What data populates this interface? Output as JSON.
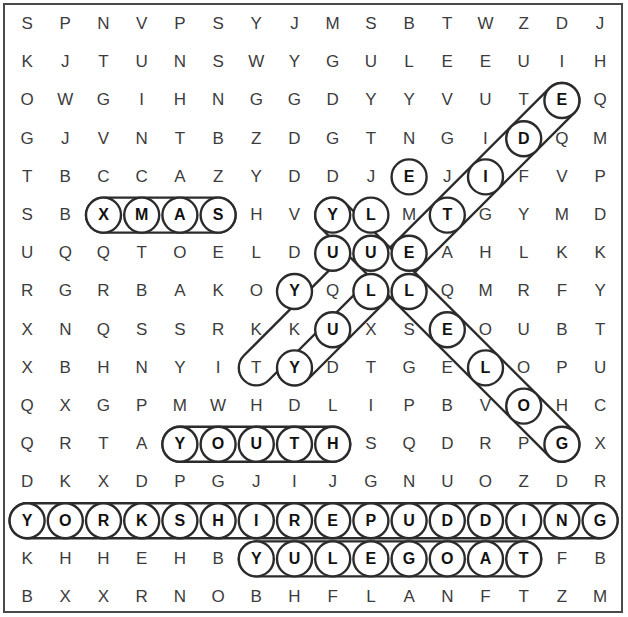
{
  "puzzle": {
    "type": "word-search",
    "rows": 16,
    "cols": 17,
    "border_color": "#4a4a4a",
    "letter_color": "#3c3c3c",
    "found_letter_color": "#111111",
    "highlight_color": "#2b2b2b",
    "grid": [
      [
        "S",
        "P",
        "N",
        "V",
        "P",
        "S",
        "Y",
        "J",
        "M",
        "S",
        "B",
        "T",
        "W",
        "Z",
        "D",
        "J",
        ""
      ],
      [
        "K",
        "J",
        "T",
        "U",
        "N",
        "S",
        "W",
        "Y",
        "G",
        "U",
        "L",
        "E",
        "E",
        "U",
        "I",
        "H",
        ""
      ],
      [
        "O",
        "W",
        "G",
        "I",
        "H",
        "N",
        "G",
        "G",
        "D",
        "Y",
        "Y",
        "V",
        "U",
        "T",
        "E",
        "Q",
        ""
      ],
      [
        "G",
        "J",
        "V",
        "N",
        "T",
        "B",
        "Z",
        "D",
        "G",
        "T",
        "N",
        "G",
        "I",
        "D",
        "Q",
        "M",
        ""
      ],
      [
        "T",
        "B",
        "C",
        "C",
        "A",
        "Z",
        "Y",
        "D",
        "D",
        "J",
        "E",
        "J",
        "I",
        "F",
        "V",
        "P",
        ""
      ],
      [
        "S",
        "B",
        "X",
        "M",
        "A",
        "S",
        "H",
        "V",
        "Y",
        "L",
        "M",
        "T",
        "G",
        "Y",
        "M",
        "D",
        ""
      ],
      [
        "U",
        "Q",
        "Q",
        "T",
        "O",
        "E",
        "L",
        "D",
        "U",
        "U",
        "E",
        "A",
        "H",
        "L",
        "K",
        "K",
        ""
      ],
      [
        "R",
        "G",
        "R",
        "B",
        "A",
        "K",
        "O",
        "Y",
        "Q",
        "L",
        "L",
        "Q",
        "M",
        "R",
        "F",
        "Y",
        ""
      ],
      [
        "X",
        "N",
        "Q",
        "S",
        "S",
        "R",
        "K",
        "K",
        "U",
        "X",
        "S",
        "E",
        "O",
        "U",
        "B",
        "T",
        ""
      ],
      [
        "X",
        "B",
        "H",
        "N",
        "Y",
        "I",
        "T",
        "Y",
        "D",
        "T",
        "G",
        "E",
        "L",
        "O",
        "P",
        "U",
        ""
      ],
      [
        "Q",
        "X",
        "G",
        "P",
        "M",
        "W",
        "H",
        "D",
        "L",
        "I",
        "P",
        "B",
        "V",
        "O",
        "H",
        "C",
        ""
      ],
      [
        "Q",
        "R",
        "T",
        "A",
        "Y",
        "O",
        "U",
        "T",
        "H",
        "S",
        "Q",
        "D",
        "R",
        "P",
        "G",
        "X",
        ""
      ],
      [
        "D",
        "K",
        "X",
        "D",
        "P",
        "G",
        "J",
        "I",
        "J",
        "G",
        "N",
        "U",
        "O",
        "Z",
        "D",
        "R",
        ""
      ],
      [
        "Y",
        "O",
        "R",
        "K",
        "S",
        "H",
        "I",
        "R",
        "E",
        "P",
        "U",
        "D",
        "D",
        "I",
        "N",
        "G",
        ""
      ],
      [
        "K",
        "H",
        "H",
        "E",
        "H",
        "B",
        "Y",
        "U",
        "L",
        "E",
        "G",
        "O",
        "A",
        "T",
        "F",
        "B",
        ""
      ],
      [
        "B",
        "X",
        "X",
        "R",
        "N",
        "O",
        "B",
        "H",
        "F",
        "L",
        "A",
        "N",
        "F",
        "T",
        "Z",
        "M",
        ""
      ]
    ],
    "found_words": [
      {
        "word": "XMAS",
        "orientation": "horizontal",
        "row": 5,
        "col": 2,
        "length": 4
      },
      {
        "word": "YULETIDE",
        "orientation": "diagonal-up-right",
        "row": 9,
        "col": 7,
        "length": 8
      },
      {
        "word": "YULE",
        "orientation": "diagonal-up-right",
        "row": 9,
        "col": 6,
        "length": 4
      },
      {
        "word": "YULELOG",
        "orientation": "diagonal-down-right",
        "row": 5,
        "col": 8,
        "length": 7
      },
      {
        "word": "YOUTH",
        "orientation": "horizontal",
        "row": 11,
        "col": 4,
        "length": 5
      },
      {
        "word": "YORKSHIREPUDDING",
        "orientation": "horizontal",
        "row": 13,
        "col": 0,
        "length": 16
      },
      {
        "word": "YULEGOAT",
        "orientation": "horizontal",
        "row": 14,
        "col": 6,
        "length": 8
      }
    ],
    "circled_cells": [
      {
        "row": 2,
        "col": 14,
        "letter": "E"
      },
      {
        "row": 3,
        "col": 13,
        "letter": "D"
      },
      {
        "row": 4,
        "col": 10,
        "letter": "E"
      },
      {
        "row": 4,
        "col": 12,
        "letter": "I"
      },
      {
        "row": 5,
        "col": 2,
        "letter": "X"
      },
      {
        "row": 5,
        "col": 3,
        "letter": "M"
      },
      {
        "row": 5,
        "col": 4,
        "letter": "A"
      },
      {
        "row": 5,
        "col": 5,
        "letter": "S"
      },
      {
        "row": 5,
        "col": 8,
        "letter": "Y"
      },
      {
        "row": 5,
        "col": 9,
        "letter": "L"
      },
      {
        "row": 5,
        "col": 11,
        "letter": "T"
      },
      {
        "row": 6,
        "col": 8,
        "letter": "U"
      },
      {
        "row": 6,
        "col": 9,
        "letter": "U"
      },
      {
        "row": 6,
        "col": 10,
        "letter": "E"
      },
      {
        "row": 7,
        "col": 7,
        "letter": "Y"
      },
      {
        "row": 7,
        "col": 9,
        "letter": "L"
      },
      {
        "row": 7,
        "col": 10,
        "letter": "L"
      },
      {
        "row": 8,
        "col": 8,
        "letter": "U"
      },
      {
        "row": 8,
        "col": 11,
        "letter": "E"
      },
      {
        "row": 9,
        "col": 7,
        "letter": "Y"
      },
      {
        "row": 9,
        "col": 12,
        "letter": "L"
      },
      {
        "row": 10,
        "col": 13,
        "letter": "O"
      },
      {
        "row": 11,
        "col": 4,
        "letter": "Y"
      },
      {
        "row": 11,
        "col": 5,
        "letter": "O"
      },
      {
        "row": 11,
        "col": 6,
        "letter": "U"
      },
      {
        "row": 11,
        "col": 7,
        "letter": "T"
      },
      {
        "row": 11,
        "col": 8,
        "letter": "H"
      },
      {
        "row": 11,
        "col": 14,
        "letter": "G"
      },
      {
        "row": 13,
        "col": 0,
        "letter": "Y"
      },
      {
        "row": 13,
        "col": 1,
        "letter": "O"
      },
      {
        "row": 13,
        "col": 2,
        "letter": "R"
      },
      {
        "row": 13,
        "col": 3,
        "letter": "K"
      },
      {
        "row": 13,
        "col": 4,
        "letter": "S"
      },
      {
        "row": 13,
        "col": 5,
        "letter": "H"
      },
      {
        "row": 13,
        "col": 6,
        "letter": "I"
      },
      {
        "row": 13,
        "col": 7,
        "letter": "R"
      },
      {
        "row": 13,
        "col": 8,
        "letter": "E"
      },
      {
        "row": 13,
        "col": 9,
        "letter": "P"
      },
      {
        "row": 13,
        "col": 10,
        "letter": "U"
      },
      {
        "row": 13,
        "col": 11,
        "letter": "D"
      },
      {
        "row": 13,
        "col": 12,
        "letter": "D"
      },
      {
        "row": 13,
        "col": 13,
        "letter": "I"
      },
      {
        "row": 13,
        "col": 14,
        "letter": "N"
      },
      {
        "row": 13,
        "col": 15,
        "letter": "G"
      },
      {
        "row": 14,
        "col": 6,
        "letter": "Y"
      },
      {
        "row": 14,
        "col": 7,
        "letter": "U"
      },
      {
        "row": 14,
        "col": 8,
        "letter": "L"
      },
      {
        "row": 14,
        "col": 9,
        "letter": "E"
      },
      {
        "row": 14,
        "col": 10,
        "letter": "G"
      },
      {
        "row": 14,
        "col": 11,
        "letter": "O"
      },
      {
        "row": 14,
        "col": 12,
        "letter": "A"
      },
      {
        "row": 14,
        "col": 13,
        "letter": "T"
      }
    ],
    "geometry": {
      "origin_x": 8,
      "origin_y": 5,
      "cell_w": 38.2,
      "cell_h": 38.2,
      "radius": 17.5
    }
  }
}
